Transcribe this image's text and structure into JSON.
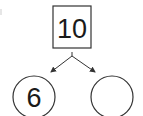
{
  "diagram": {
    "type": "number-bond",
    "whole": {
      "value": "10",
      "shape": "square"
    },
    "parts": [
      {
        "value": "6",
        "shape": "circle"
      },
      {
        "value": "",
        "shape": "circle"
      }
    ],
    "stroke_color": "#333333"
  }
}
